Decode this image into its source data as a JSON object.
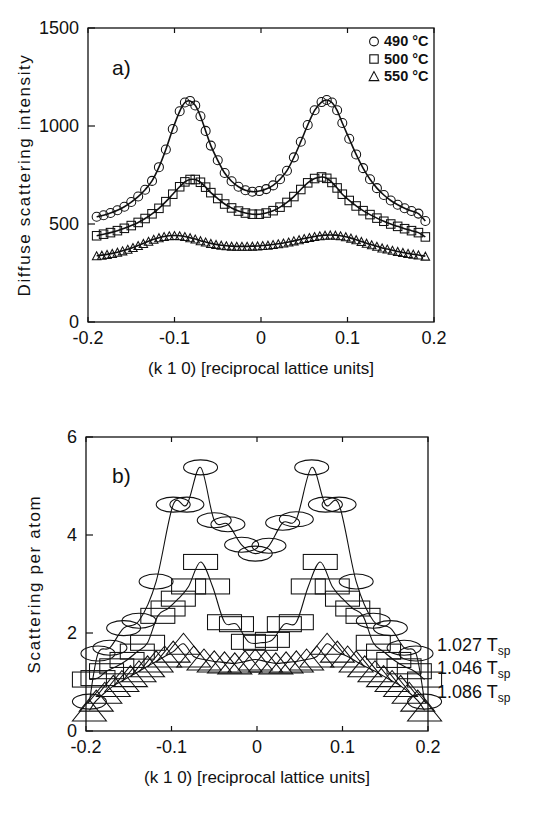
{
  "figure": {
    "type": "scientific-figure",
    "panels": 2,
    "background": "#ffffff",
    "ink": "#111111"
  },
  "chart_data": [
    {
      "id": "panel-a",
      "type": "scatter",
      "panel_label": "a)",
      "title": "",
      "xlabel": "(k 1 0) [reciprocal lattice units]",
      "ylabel": "Diffuse scattering intensity",
      "xlim": [
        -0.2,
        0.2
      ],
      "ylim": [
        0,
        1500
      ],
      "xticks": [
        -0.2,
        -0.1,
        0,
        0.1,
        0.2
      ],
      "xticklabels": [
        "-0.2",
        "-0.1",
        "0",
        "0.1",
        "0.2"
      ],
      "yticks": [
        0,
        500,
        1000,
        1500
      ],
      "yticklabels": [
        "0",
        "500",
        "1000",
        "1500"
      ],
      "grid": false,
      "legend_position": "top-right",
      "legend": [
        {
          "marker": "circle",
          "label": "490 °C"
        },
        {
          "marker": "square",
          "label": "500 °C"
        },
        {
          "marker": "triangle",
          "label": "550 °C"
        }
      ],
      "series": [
        {
          "name": "490 °C",
          "marker": "circle",
          "fit_line": true,
          "x": [
            -0.19,
            -0.182,
            -0.174,
            -0.166,
            -0.158,
            -0.15,
            -0.142,
            -0.134,
            -0.126,
            -0.118,
            -0.11,
            -0.102,
            -0.094,
            -0.088,
            -0.082,
            -0.076,
            -0.07,
            -0.064,
            -0.058,
            -0.05,
            -0.042,
            -0.034,
            -0.026,
            -0.018,
            -0.01,
            -0.002,
            0.006,
            0.014,
            0.022,
            0.03,
            0.038,
            0.046,
            0.054,
            0.062,
            0.07,
            0.076,
            0.082,
            0.088,
            0.094,
            0.102,
            0.11,
            0.118,
            0.126,
            0.134,
            0.142,
            0.15,
            0.158,
            0.166,
            0.174,
            0.182,
            0.19
          ],
          "y": [
            537,
            545,
            556,
            570,
            588,
            612,
            640,
            675,
            720,
            790,
            880,
            985,
            1075,
            1120,
            1128,
            1105,
            1050,
            975,
            900,
            825,
            760,
            718,
            690,
            672,
            665,
            668,
            678,
            697,
            728,
            772,
            840,
            920,
            1005,
            1080,
            1122,
            1133,
            1120,
            1080,
            1015,
            935,
            855,
            785,
            728,
            683,
            648,
            620,
            598,
            580,
            566,
            553,
            515
          ]
        },
        {
          "name": "500 °C",
          "marker": "square",
          "fit_line": true,
          "x": [
            -0.19,
            -0.182,
            -0.174,
            -0.166,
            -0.158,
            -0.15,
            -0.142,
            -0.134,
            -0.126,
            -0.118,
            -0.11,
            -0.102,
            -0.094,
            -0.088,
            -0.082,
            -0.076,
            -0.07,
            -0.064,
            -0.058,
            -0.05,
            -0.042,
            -0.034,
            -0.026,
            -0.018,
            -0.01,
            -0.002,
            0.006,
            0.014,
            0.022,
            0.03,
            0.038,
            0.046,
            0.054,
            0.062,
            0.07,
            0.076,
            0.082,
            0.088,
            0.094,
            0.102,
            0.11,
            0.118,
            0.126,
            0.134,
            0.142,
            0.15,
            0.158,
            0.166,
            0.174,
            0.182,
            0.19
          ],
          "y": [
            440,
            448,
            456,
            466,
            478,
            492,
            508,
            528,
            552,
            580,
            614,
            652,
            690,
            715,
            727,
            727,
            713,
            688,
            660,
            630,
            602,
            582,
            566,
            556,
            550,
            550,
            556,
            568,
            586,
            610,
            640,
            676,
            710,
            732,
            740,
            733,
            712,
            684,
            652,
            620,
            592,
            568,
            548,
            530,
            514,
            500,
            488,
            476,
            466,
            456,
            434
          ]
        },
        {
          "name": "550 °C",
          "marker": "triangle",
          "fit_line": true,
          "x": [
            -0.19,
            -0.184,
            -0.178,
            -0.172,
            -0.166,
            -0.16,
            -0.154,
            -0.148,
            -0.142,
            -0.136,
            -0.13,
            -0.124,
            -0.118,
            -0.112,
            -0.106,
            -0.1,
            -0.094,
            -0.088,
            -0.082,
            -0.076,
            -0.07,
            -0.064,
            -0.058,
            -0.052,
            -0.046,
            -0.04,
            -0.034,
            -0.028,
            -0.022,
            -0.016,
            -0.01,
            -0.004,
            0.002,
            0.008,
            0.014,
            0.02,
            0.026,
            0.032,
            0.038,
            0.044,
            0.05,
            0.056,
            0.062,
            0.068,
            0.074,
            0.08,
            0.086,
            0.092,
            0.098,
            0.104,
            0.11,
            0.116,
            0.122,
            0.128,
            0.134,
            0.14,
            0.146,
            0.152,
            0.158,
            0.164,
            0.17,
            0.176,
            0.182,
            0.19
          ],
          "y": [
            338,
            341,
            345,
            350,
            356,
            363,
            371,
            380,
            390,
            401,
            412,
            422,
            430,
            436,
            440,
            441,
            440,
            436,
            430,
            423,
            415,
            408,
            401,
            396,
            392,
            389,
            387,
            386,
            386,
            386,
            387,
            388,
            390,
            392,
            395,
            399,
            403,
            408,
            414,
            420,
            426,
            431,
            436,
            440,
            443,
            444,
            443,
            440,
            435,
            428,
            420,
            411,
            402,
            394,
            386,
            378,
            372,
            366,
            360,
            355,
            350,
            346,
            342,
            336
          ]
        }
      ]
    },
    {
      "id": "panel-b",
      "type": "scatter",
      "panel_label": "b)",
      "title": "",
      "xlabel": "(k 1 0) [reciprocal lattice units]",
      "ylabel": "Scattering per atom",
      "xlim": [
        -0.2,
        0.2
      ],
      "ylim": [
        0,
        6
      ],
      "xticks": [
        -0.2,
        -0.1,
        0,
        0.1,
        0.2
      ],
      "xticklabels": [
        "-0.2",
        "-0.1",
        "0",
        "0.1",
        "0.2"
      ],
      "yticks": [
        0,
        2,
        4,
        6
      ],
      "yticklabels": [
        "0",
        "2",
        "4",
        "6"
      ],
      "grid": false,
      "right_labels": [
        {
          "text": "1.027 T",
          "sub": "sp",
          "series": "1.027 Tsp"
        },
        {
          "text": "1.046 T",
          "sub": "sp",
          "series": "1.046 Tsp"
        },
        {
          "text": "1.086 T",
          "sub": "sp",
          "series": "1.086 Tsp"
        }
      ],
      "series": [
        {
          "name": "1.027 Tsp",
          "marker": "ellipse",
          "fit_line": true,
          "x": [
            -0.196,
            -0.186,
            -0.172,
            -0.156,
            -0.138,
            -0.118,
            -0.098,
            -0.082,
            -0.066,
            -0.05,
            -0.034,
            -0.018,
            -0.002,
            0.014,
            0.03,
            0.046,
            0.064,
            0.08,
            0.096,
            0.116,
            0.136,
            0.156,
            0.172,
            0.186,
            0.196
          ],
          "y": [
            0.6,
            1.58,
            1.7,
            2.1,
            2.25,
            3.05,
            4.62,
            4.62,
            5.38,
            4.3,
            4.22,
            3.8,
            3.62,
            3.78,
            4.25,
            4.32,
            5.38,
            4.62,
            4.62,
            3.05,
            2.25,
            2.1,
            1.7,
            1.58,
            0.6
          ]
        },
        {
          "name": "1.046 Tsp",
          "marker": "rect",
          "fit_line": true,
          "x": [
            -0.196,
            -0.186,
            -0.176,
            -0.164,
            -0.152,
            -0.14,
            -0.128,
            -0.116,
            -0.104,
            -0.092,
            -0.08,
            -0.066,
            -0.052,
            -0.038,
            -0.024,
            -0.01,
            0.004,
            0.018,
            0.032,
            0.046,
            0.06,
            0.074,
            0.088,
            0.1,
            0.112,
            0.124,
            0.136,
            0.148,
            0.16,
            0.172,
            0.184,
            0.196
          ],
          "y": [
            1.05,
            1.08,
            1.22,
            1.32,
            1.45,
            1.62,
            1.8,
            2.35,
            2.5,
            2.7,
            2.95,
            3.45,
            2.95,
            2.22,
            2.18,
            1.82,
            1.8,
            1.86,
            2.18,
            2.22,
            2.95,
            3.45,
            2.95,
            2.7,
            2.5,
            2.35,
            1.8,
            1.62,
            1.45,
            1.32,
            1.22,
            1.05
          ]
        },
        {
          "name": "1.086 Tsp",
          "marker": "triangle",
          "fit_line": true,
          "x": [
            -0.196,
            -0.188,
            -0.178,
            -0.168,
            -0.158,
            -0.148,
            -0.138,
            -0.128,
            -0.118,
            -0.108,
            -0.098,
            -0.086,
            -0.074,
            -0.062,
            -0.05,
            -0.038,
            -0.026,
            -0.014,
            -0.002,
            0.01,
            0.022,
            0.034,
            0.046,
            0.058,
            0.07,
            0.082,
            0.094,
            0.106,
            0.116,
            0.126,
            0.138,
            0.148,
            0.158,
            0.168,
            0.178,
            0.188,
            0.196
          ],
          "y": [
            0.42,
            0.62,
            0.78,
            0.92,
            1.02,
            1.12,
            1.22,
            1.32,
            1.42,
            1.52,
            1.62,
            1.78,
            1.52,
            1.46,
            1.42,
            1.4,
            1.38,
            1.42,
            1.46,
            1.42,
            1.38,
            1.4,
            1.42,
            1.46,
            1.52,
            1.78,
            1.62,
            1.52,
            1.42,
            1.32,
            1.22,
            1.12,
            1.02,
            0.92,
            0.78,
            0.62,
            0.42
          ]
        }
      ]
    }
  ]
}
